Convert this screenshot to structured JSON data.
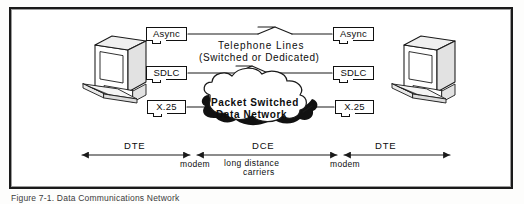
{
  "figure": {
    "caption": "Figure 7-1.  Data Communications Network",
    "border_color": "#1a1a1a",
    "background_color": "#ffffff",
    "ink_color": "#0d0d0d"
  },
  "terminals": [
    {
      "name": "left-terminal",
      "label": "DTE terminal (left)"
    },
    {
      "name": "right-terminal",
      "label": "DTE terminal (right)"
    }
  ],
  "protocol_labels": {
    "left": [
      {
        "id": "async-left",
        "text": "Async"
      },
      {
        "id": "sdlc-left",
        "text": "SDLC"
      },
      {
        "id": "x25-left",
        "text": "X.25"
      }
    ],
    "right": [
      {
        "id": "async-right",
        "text": "Async"
      },
      {
        "id": "sdlc-right",
        "text": "SDLC"
      },
      {
        "id": "x25-right",
        "text": "X.25"
      }
    ]
  },
  "links": {
    "telephone_line_1": "Telephone Lines",
    "telephone_line_2": "(Switched or Dedicated)"
  },
  "cloud": {
    "line1": "Packet  Switched",
    "line2": "Data  Network"
  },
  "spans": {
    "dte_left": "DTE",
    "dce": "DCE",
    "dte_right": "DTE",
    "modem_left": "modem",
    "modem_right": "modem",
    "carriers_line1": "long  distance",
    "carriers_line2": "carriers"
  }
}
